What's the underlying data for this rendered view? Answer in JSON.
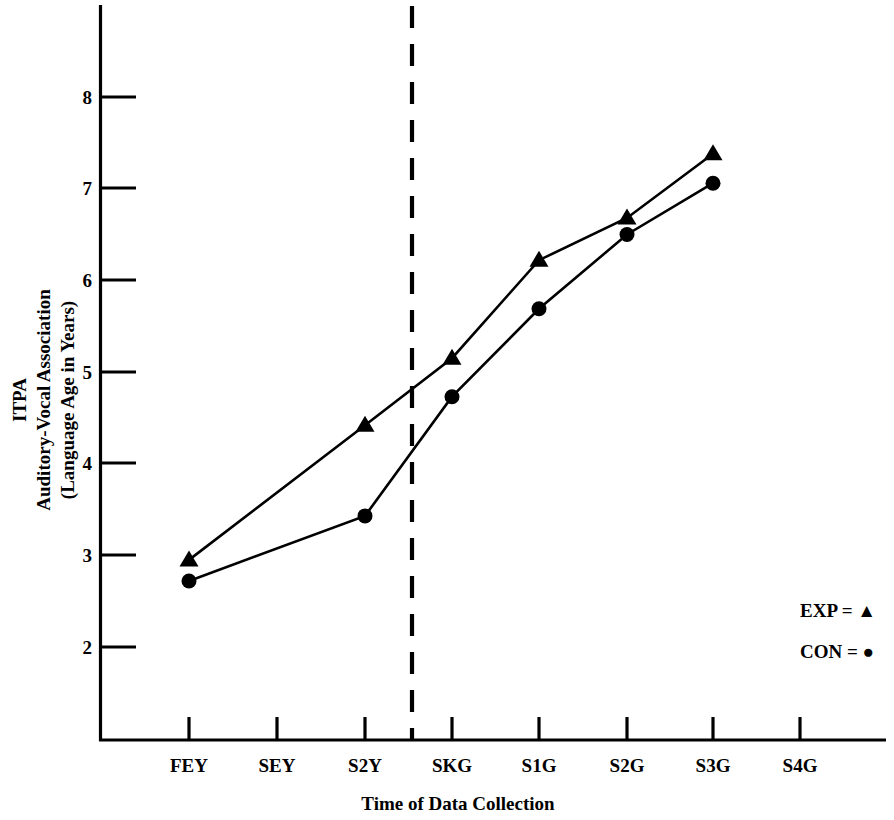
{
  "chart_data": {
    "type": "line",
    "title": "",
    "xlabel": "Time of Data Collection",
    "ylabel": "ITPA Auditory-Vocal Association (Language Age in Years)",
    "ylabel_lines": [
      "ITPA",
      "Auditory-Vocal Association",
      "(Language Age in Years)"
    ],
    "categories": [
      "FEY",
      "SEY",
      "S2Y",
      "SKG",
      "S1G",
      "S2G",
      "S3G",
      "S4G"
    ],
    "ytick_labels": [
      "8",
      "7",
      "6",
      "5",
      "4",
      "3",
      "2"
    ],
    "yticks": [
      8,
      7,
      6,
      5,
      4,
      3,
      2
    ],
    "ylim": [
      1.35,
      8.7
    ],
    "grid": false,
    "legend_position": "right-middle",
    "series": [
      {
        "name": "EXP",
        "marker": "triangle",
        "color": "#000000",
        "x": [
          "FEY",
          "S2Y",
          "SKG",
          "S1G",
          "S2G",
          "S3G"
        ],
        "values": [
          2.95,
          4.42,
          5.15,
          6.22,
          6.68,
          7.38
        ]
      },
      {
        "name": "CON",
        "marker": "circle",
        "color": "#000000",
        "x": [
          "FEY",
          "S2Y",
          "SKG",
          "S1G",
          "S2G",
          "S3G"
        ],
        "values": [
          2.72,
          3.43,
          4.73,
          5.69,
          6.5,
          7.06
        ]
      }
    ],
    "annotations": [
      {
        "type": "vertical-dashed-line",
        "position_between": [
          "S2Y",
          "SKG"
        ],
        "label": ""
      }
    ]
  },
  "legend": {
    "entries": [
      {
        "label": "EXP",
        "equals": "=",
        "symbol": "triangle",
        "text": "EXP = ▲"
      },
      {
        "label": "CON",
        "equals": "=",
        "symbol": "circle",
        "text": "CON = ●"
      }
    ]
  },
  "axes": {
    "x_title": "Time of Data Collection",
    "y_title_line1": "ITPA",
    "y_title_line2": "Auditory-Vocal Association",
    "y_title_line3": "(Language Age in Years)"
  }
}
